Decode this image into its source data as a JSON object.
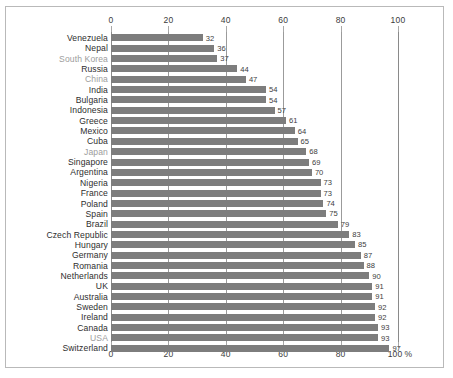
{
  "chart_data": {
    "type": "bar",
    "orientation": "horizontal",
    "title": "",
    "subtitle": "",
    "xlabel": "%",
    "ylabel": "",
    "xlim": [
      0,
      100
    ],
    "grid": true,
    "legend": null,
    "axis_ticks": [
      0,
      20,
      40,
      60,
      80,
      100
    ],
    "axis_tick_labels_top": [
      "0",
      "20",
      "40",
      "60",
      "80",
      "100"
    ],
    "axis_tick_labels_bottom": [
      "0",
      "20",
      "40",
      "60",
      "80",
      "100"
    ],
    "axis_unit_suffix": "%",
    "categories": [
      "Venezuela",
      "Nepal",
      "South Korea",
      "Russia",
      "China",
      "India",
      "Bulgaria",
      "Indonesia",
      "Greece",
      "Mexico",
      "Cuba",
      "Japan",
      "Singapore",
      "Argentina",
      "Nigeria",
      "France",
      "Poland",
      "Spain",
      "Brazil",
      "Czech Republic",
      "Hungary",
      "Germany",
      "Romania",
      "Netherlands",
      "UK",
      "Australia",
      "Sweden",
      "Ireland",
      "Canada",
      "USA",
      "Switzerland"
    ],
    "values": [
      32,
      36,
      37,
      44,
      47,
      54,
      54,
      57,
      61,
      64,
      65,
      68,
      69,
      70,
      73,
      73,
      74,
      75,
      79,
      83,
      85,
      87,
      88,
      90,
      91,
      91,
      92,
      92,
      93,
      93,
      97
    ],
    "highlighted_categories": [
      "South Korea",
      "China",
      "Japan",
      "USA"
    ],
    "colors": {
      "bar": "#7d7d7d",
      "label": "#2e2e2e",
      "label_muted": "#9d9d9d",
      "gridline": "#9b9b9b",
      "frame": "#b9b9b9",
      "background": "#ffffff"
    }
  }
}
